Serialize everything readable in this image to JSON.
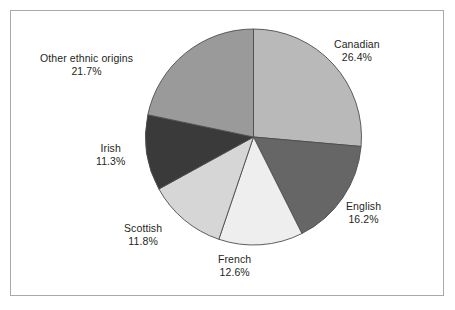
{
  "chart_data": {
    "type": "pie",
    "title": "",
    "subtitle": "",
    "xlabel": "",
    "ylabel": "",
    "legend_position": "none",
    "grid": false,
    "units": "percent",
    "start_angle_deg": 0,
    "direction": "clockwise",
    "categories": [
      "Canadian",
      "English",
      "French",
      "Scottish",
      "Irish",
      "Other ethnic origins"
    ],
    "values": [
      26.4,
      16.2,
      12.6,
      11.8,
      11.3,
      21.7
    ],
    "slices": [
      {
        "label": "Canadian",
        "value": 26.4,
        "value_text": "26.4%",
        "color": "#b9b9b9"
      },
      {
        "label": "English",
        "value": 16.2,
        "value_text": "16.2%",
        "color": "#666666"
      },
      {
        "label": "French",
        "value": 12.6,
        "value_text": "12.6%",
        "color": "#eeeeee"
      },
      {
        "label": "Scottish",
        "value": 11.8,
        "value_text": "11.8%",
        "color": "#d6d6d6"
      },
      {
        "label": "Irish",
        "value": 11.3,
        "value_text": "11.3%",
        "color": "#3a3a3a"
      },
      {
        "label": "Other ethnic origins",
        "value": 21.7,
        "value_text": "21.7%",
        "color": "#9a9a9a"
      }
    ]
  },
  "figure": {
    "frame_color": "#a9a9a9",
    "background": "#ffffff",
    "slice_outline_color": "#4d4d4d",
    "text_color": "#231f20"
  }
}
